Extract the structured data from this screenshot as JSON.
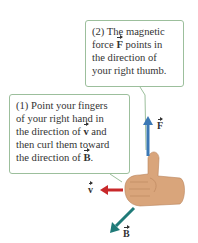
{
  "callout_2": {
    "lines": [
      "(2) The magnetic",
      "force ",
      " points in",
      "the direction of",
      "your right thumb."
    ],
    "vector": "F"
  },
  "callout_1": {
    "lines": [
      "(1) Point your fingers",
      "of your right hand in",
      "the direction of ",
      " and",
      "then curl them toward",
      "the direction of ",
      "."
    ],
    "vector_v": "v",
    "vector_B": "B"
  },
  "labels": {
    "F": "F",
    "v": "v",
    "B": "B"
  },
  "colors": {
    "F_arrow": "#3b78b5",
    "v_arrow": "#c8282a",
    "B_arrow": "#1f7a78",
    "box_border": "#9cbf9c",
    "hand": "#d9a57b"
  }
}
